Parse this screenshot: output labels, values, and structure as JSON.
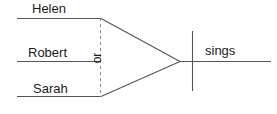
{
  "diagram": {
    "type": "reed-kellogg-sentence-diagram",
    "sentence": "Helen, Robert or Sarah sings",
    "colors": {
      "line": "#555555",
      "dashed_line": "#888888",
      "text": "#1a1a1a",
      "background": "#ffffff"
    },
    "subjects": [
      {
        "label": "Helen"
      },
      {
        "label": "Robert"
      },
      {
        "label": "Sarah"
      }
    ],
    "conjunction": {
      "label": "or"
    },
    "predicate": {
      "label": "sings"
    }
  }
}
